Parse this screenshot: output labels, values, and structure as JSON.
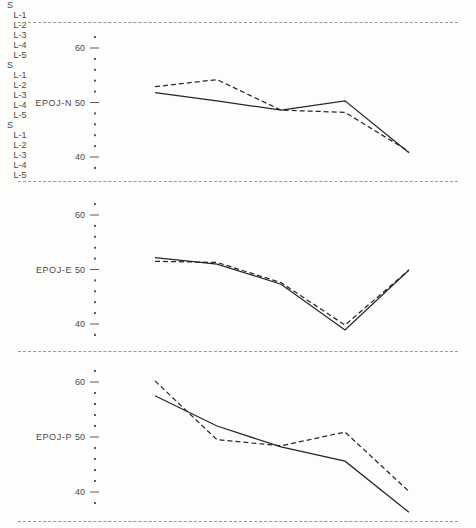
{
  "chart_data": {
    "type": "line",
    "title": "",
    "xlabel": "",
    "ylabel": "",
    "grid": false,
    "legend_position": "none",
    "origin_label": "S",
    "categories": [
      "L-1",
      "L-2",
      "L-3",
      "L-4",
      "L-5"
    ],
    "ylim": [
      35,
      62
    ],
    "yticks": [
      40,
      50,
      60
    ],
    "ytick_labels": [
      "40",
      "50",
      "60"
    ],
    "minor_ticks_per_interval": 4,
    "panels": [
      {
        "label": "EPOJ-N",
        "series": [
          {
            "name": "solid",
            "style": "solid",
            "values": [
              51.8,
              50.3,
              48.6,
              50.3,
              40.8
            ]
          },
          {
            "name": "dashed",
            "style": "dashed",
            "values": [
              52.9,
              54.2,
              48.6,
              48.2,
              41.0
            ]
          }
        ]
      },
      {
        "label": "EPOJ-E",
        "series": [
          {
            "name": "solid",
            "style": "solid",
            "values": [
              52.2,
              51.0,
              47.3,
              38.9,
              49.9
            ]
          },
          {
            "name": "dashed",
            "style": "dashed",
            "values": [
              51.5,
              51.3,
              47.6,
              39.8,
              49.9
            ]
          }
        ]
      },
      {
        "label": "EPOJ-P",
        "series": [
          {
            "name": "solid",
            "style": "solid",
            "values": [
              57.5,
              52.0,
              48.2,
              45.6,
              36.3
            ]
          },
          {
            "name": "dashed",
            "style": "dashed",
            "values": [
              60.2,
              49.5,
              48.4,
              50.9,
              40.1
            ]
          }
        ]
      }
    ]
  },
  "colors": {
    "ink": "#262626",
    "axis": "#5a5a5a",
    "separator": "#9a9a9a",
    "background": "#fdfdfc"
  }
}
